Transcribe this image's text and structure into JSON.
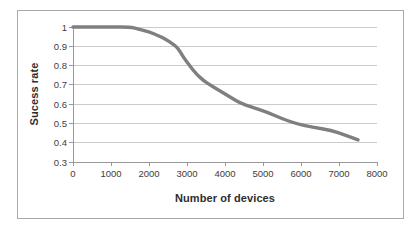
{
  "chart_data": {
    "type": "line",
    "title": "",
    "xlabel": "Number of devices",
    "ylabel": "Sucess rate",
    "xlim": [
      0,
      8000
    ],
    "ylim": [
      0.3,
      1.0
    ],
    "xticks": [
      "0",
      "1000",
      "2000",
      "3000",
      "4000",
      "5000",
      "6000",
      "7000",
      "8000"
    ],
    "yticks": [
      "1",
      "0.9",
      "0.8",
      "0.7",
      "0.6",
      "0.5",
      "0.4",
      "0.3"
    ],
    "grid": "horizontal-only",
    "legend": "none",
    "series": [
      {
        "points": [
          [
            0,
            1.0
          ],
          [
            500,
            1.0
          ],
          [
            1000,
            1.0
          ],
          [
            1500,
            1.0
          ],
          [
            1700,
            0.99
          ],
          [
            2000,
            0.975
          ],
          [
            2250,
            0.955
          ],
          [
            2450,
            0.935
          ],
          [
            2600,
            0.915
          ],
          [
            2750,
            0.895
          ],
          [
            2900,
            0.845
          ],
          [
            3050,
            0.805
          ],
          [
            3250,
            0.755
          ],
          [
            3450,
            0.72
          ],
          [
            3600,
            0.7
          ],
          [
            3900,
            0.665
          ],
          [
            4150,
            0.635
          ],
          [
            4400,
            0.605
          ],
          [
            4700,
            0.585
          ],
          [
            5150,
            0.555
          ],
          [
            5500,
            0.525
          ],
          [
            5850,
            0.5
          ],
          [
            6300,
            0.48
          ],
          [
            6800,
            0.465
          ],
          [
            7150,
            0.44
          ],
          [
            7500,
            0.415
          ]
        ]
      }
    ],
    "colors": {
      "curve": "#7f7f7f",
      "gridline": "#cbcbcb",
      "axis": "#999999",
      "tick_label": "#3d3d3d",
      "axis_title": "#2e2e2e",
      "chart_border": "#a9a9a9",
      "chart_background": "#ffffff"
    }
  }
}
